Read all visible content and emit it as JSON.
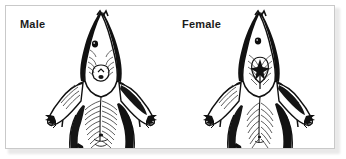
{
  "figure": {
    "kind": "scientific-line-illustration",
    "caption_labels": [
      {
        "id": "male",
        "label": "Male"
      },
      {
        "id": "female",
        "label": "Female"
      }
    ],
    "view": "ventral",
    "panel": {
      "background_color": "#ffffff",
      "border_color": "#c9c9c9",
      "shadow_color": "#d8d8d8"
    },
    "ink_color": "#111111",
    "label_color": "#1b1b1b"
  },
  "specimens": [
    {
      "id": "male",
      "label": "Male",
      "label_x": 14,
      "label_y": 13,
      "center_x": 95,
      "anogenital_spacing": "wide"
    },
    {
      "id": "female",
      "label": "Female",
      "label_x": 176,
      "label_y": 13,
      "center_x": 253,
      "anogenital_spacing": "narrow"
    }
  ]
}
